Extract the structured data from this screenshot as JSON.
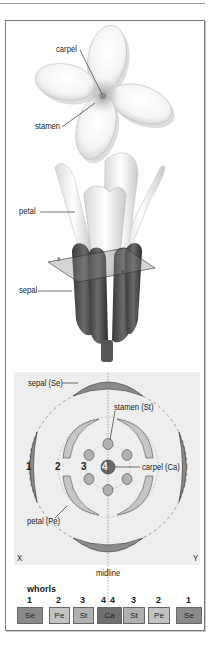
{
  "top_flower": {
    "labels": {
      "carpel": "carpel",
      "stamen": "stamen"
    }
  },
  "side_flower": {
    "labels": {
      "petal": "petal",
      "sepal": "sepal"
    },
    "section_plane_marks": {
      "left": "X",
      "right": "Y"
    }
  },
  "floral_diagram": {
    "labels": {
      "sepal": "sepal (Se)",
      "stamen": "stamen (St)",
      "carpel": "carpel (Ca)",
      "petal": "petal (Pe)"
    },
    "ring_numbers": [
      "1",
      "2",
      "3",
      "4"
    ],
    "axis_labels": {
      "left": "X",
      "right": "Y",
      "midline": "midline"
    }
  },
  "whorls": {
    "title": "whorls",
    "items": [
      {
        "num": "1",
        "abbr": "Se",
        "color": "#8a8a8a"
      },
      {
        "num": "2",
        "abbr": "Pe",
        "color": "#c2c2c2"
      },
      {
        "num": "3",
        "abbr": "St",
        "color": "#b0b0b0"
      },
      {
        "num": "4",
        "abbr": "Ca",
        "color": "#6e6e6e"
      },
      {
        "num": "4",
        "abbr": "Ca",
        "color": "#6e6e6e"
      },
      {
        "num": "3",
        "abbr": "St",
        "color": "#b0b0b0"
      },
      {
        "num": "2",
        "abbr": "Pe",
        "color": "#c2c2c2"
      },
      {
        "num": "1",
        "abbr": "Se",
        "color": "#8a8a8a"
      }
    ]
  },
  "colors": {
    "sepal": "#8a8a8a",
    "petal": "#c6c6c6",
    "stamen": "#b0b0b0",
    "carpel": "#6a6a6a",
    "panel": "#eeeeee",
    "dashed_ring": "#999999"
  }
}
